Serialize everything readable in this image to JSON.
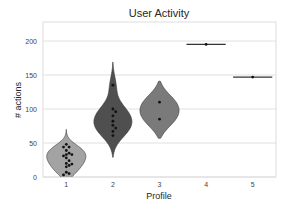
{
  "chart_data": {
    "type": "violin",
    "title": "User Activity",
    "xlabel": "Profile",
    "ylabel": "# actions",
    "categories": [
      "1",
      "2",
      "3",
      "4",
      "5"
    ],
    "ylim": [
      0,
      228
    ],
    "yticks": [
      0,
      50,
      100,
      150,
      200
    ],
    "grid": "horizontal",
    "series": [
      {
        "name": "1",
        "color": "#a3a3a3",
        "kde_range": [
          -10,
          70
        ],
        "points": [
          48,
          44,
          44,
          39,
          35,
          33,
          33,
          31,
          28,
          24,
          20,
          19,
          17,
          15,
          7,
          5,
          3
        ]
      },
      {
        "name": "2",
        "color": "#4f4f4f",
        "kde_range": [
          29,
          169
        ],
        "points": [
          135,
          100,
          96,
          90,
          82,
          76,
          72,
          67,
          61
        ]
      },
      {
        "name": "3",
        "color": "#7a7a7a",
        "kde_range": [
          57,
          141
        ],
        "points": [
          110,
          85
        ]
      },
      {
        "name": "4",
        "color": "#7a7a7a",
        "kde_range": [
          195,
          195
        ],
        "points": [
          195
        ]
      },
      {
        "name": "5",
        "color": "#7a7a7a",
        "kde_range": [
          147,
          147
        ],
        "points": [
          147
        ]
      }
    ]
  }
}
